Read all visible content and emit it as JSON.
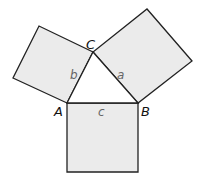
{
  "diagram": {
    "type": "pythagorean-theorem-squares",
    "colors": {
      "square_fill": "#ebebeb",
      "stroke": "#222222",
      "vertex_label": "#111111",
      "side_label": "#666666"
    },
    "vertices": {
      "A": {
        "label": "A",
        "x": 67,
        "y": 103
      },
      "B": {
        "label": "B",
        "x": 138,
        "y": 103
      },
      "C": {
        "label": "C",
        "x": 93,
        "y": 52
      }
    },
    "sides": {
      "a": {
        "label": "a",
        "between": [
          "B",
          "C"
        ]
      },
      "b": {
        "label": "b",
        "between": [
          "A",
          "C"
        ]
      },
      "c": {
        "label": "c",
        "between": [
          "A",
          "B"
        ]
      }
    },
    "squares": [
      {
        "name": "square-on-b",
        "points": "67,103 93,52 39,26 13,78"
      },
      {
        "name": "square-on-a",
        "points": "93,52 138,103 192,61 147,9"
      },
      {
        "name": "square-on-c",
        "points": "67,103 138,103 138,172 67,172"
      }
    ]
  }
}
